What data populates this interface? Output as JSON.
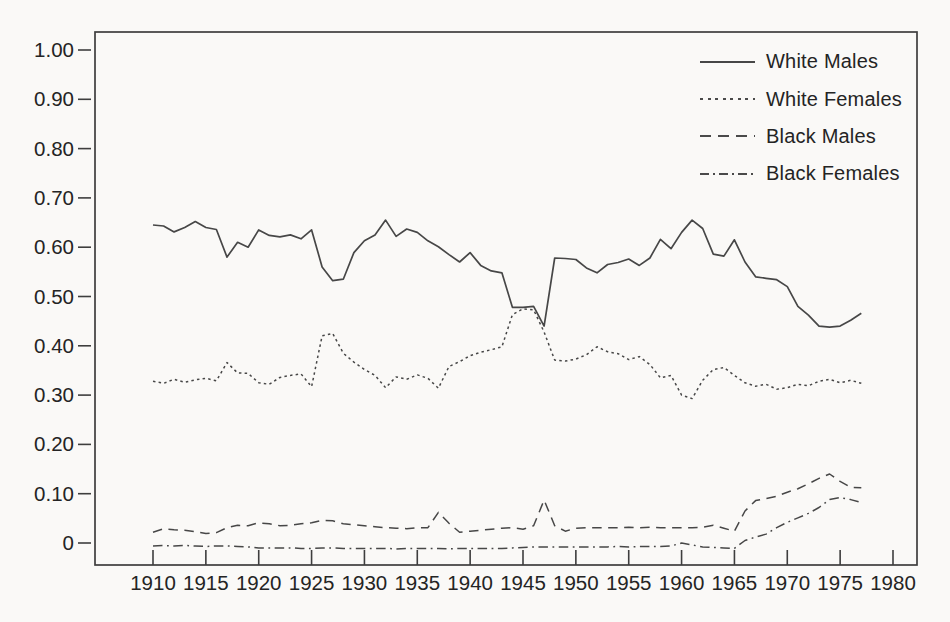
{
  "chart_data": {
    "type": "line",
    "title": "",
    "xlabel": "",
    "ylabel": "",
    "grid": false,
    "legend_position": "top-right",
    "xlim": [
      1904.5,
      1982
    ],
    "ylim": [
      -0.045,
      1.04
    ],
    "x_ticks": [
      1910,
      1915,
      1920,
      1925,
      1930,
      1935,
      1940,
      1945,
      1950,
      1955,
      1960,
      1965,
      1970,
      1975,
      1980
    ],
    "y_ticks": [
      0,
      0.1,
      0.2,
      0.3,
      0.4,
      0.5,
      0.6,
      0.7,
      0.8,
      0.9,
      1.0
    ],
    "y_tick_labels": [
      "0",
      "0.10",
      "0.20",
      "0.30",
      "0.40",
      "0.50",
      "0.60",
      "0.70",
      "0.80",
      "0.90",
      "1.00"
    ],
    "x": [
      1910,
      1911,
      1912,
      1913,
      1914,
      1915,
      1916,
      1917,
      1918,
      1919,
      1920,
      1921,
      1922,
      1923,
      1924,
      1925,
      1926,
      1927,
      1928,
      1929,
      1930,
      1931,
      1932,
      1933,
      1934,
      1935,
      1936,
      1937,
      1938,
      1939,
      1940,
      1941,
      1942,
      1943,
      1944,
      1945,
      1946,
      1947,
      1948,
      1949,
      1950,
      1951,
      1952,
      1953,
      1954,
      1955,
      1956,
      1957,
      1958,
      1959,
      1960,
      1961,
      1962,
      1963,
      1964,
      1965,
      1966,
      1967,
      1968,
      1969,
      1970,
      1971,
      1972,
      1973,
      1974,
      1975,
      1976,
      1977
    ],
    "series": [
      {
        "name": "White Males",
        "style": "solid",
        "values": [
          0.645,
          0.643,
          0.631,
          0.64,
          0.652,
          0.64,
          0.636,
          0.58,
          0.61,
          0.6,
          0.635,
          0.624,
          0.621,
          0.625,
          0.617,
          0.635,
          0.56,
          0.532,
          0.535,
          0.589,
          0.613,
          0.625,
          0.655,
          0.622,
          0.637,
          0.63,
          0.613,
          0.601,
          0.585,
          0.57,
          0.589,
          0.563,
          0.552,
          0.548,
          0.478,
          0.478,
          0.48,
          0.44,
          0.578,
          0.577,
          0.575,
          0.558,
          0.548,
          0.565,
          0.569,
          0.576,
          0.563,
          0.578,
          0.616,
          0.597,
          0.63,
          0.655,
          0.638,
          0.586,
          0.582,
          0.615,
          0.57,
          0.54,
          0.537,
          0.534,
          0.52,
          0.48,
          0.462,
          0.44,
          0.438,
          0.44,
          0.452,
          0.466
        ]
      },
      {
        "name": "White Females",
        "style": "dotted",
        "values": [
          0.328,
          0.324,
          0.332,
          0.326,
          0.331,
          0.334,
          0.329,
          0.366,
          0.345,
          0.344,
          0.325,
          0.322,
          0.336,
          0.34,
          0.343,
          0.317,
          0.42,
          0.425,
          0.385,
          0.367,
          0.352,
          0.34,
          0.315,
          0.337,
          0.332,
          0.341,
          0.334,
          0.314,
          0.358,
          0.368,
          0.38,
          0.387,
          0.392,
          0.398,
          0.463,
          0.475,
          0.473,
          0.428,
          0.371,
          0.369,
          0.373,
          0.382,
          0.398,
          0.388,
          0.384,
          0.372,
          0.378,
          0.362,
          0.335,
          0.34,
          0.3,
          0.293,
          0.33,
          0.352,
          0.356,
          0.34,
          0.325,
          0.318,
          0.322,
          0.312,
          0.315,
          0.322,
          0.319,
          0.328,
          0.332,
          0.325,
          0.33,
          0.324
        ]
      },
      {
        "name": "Black Males",
        "style": "dashed",
        "values": [
          0.022,
          0.029,
          0.027,
          0.026,
          0.023,
          0.019,
          0.021,
          0.031,
          0.036,
          0.035,
          0.041,
          0.039,
          0.035,
          0.036,
          0.039,
          0.041,
          0.046,
          0.045,
          0.039,
          0.037,
          0.035,
          0.033,
          0.031,
          0.03,
          0.029,
          0.031,
          0.031,
          0.062,
          0.04,
          0.022,
          0.024,
          0.026,
          0.028,
          0.03,
          0.031,
          0.028,
          0.035,
          0.087,
          0.035,
          0.024,
          0.03,
          0.031,
          0.031,
          0.031,
          0.031,
          0.032,
          0.031,
          0.032,
          0.031,
          0.031,
          0.031,
          0.031,
          0.032,
          0.036,
          0.03,
          0.024,
          0.065,
          0.086,
          0.09,
          0.095,
          0.103,
          0.11,
          0.12,
          0.131,
          0.14,
          0.125,
          0.113,
          0.112
        ]
      },
      {
        "name": "Black Females",
        "style": "dashdot",
        "values": [
          -0.006,
          -0.005,
          -0.006,
          -0.005,
          -0.006,
          -0.007,
          -0.006,
          -0.006,
          -0.007,
          -0.008,
          -0.01,
          -0.01,
          -0.01,
          -0.01,
          -0.011,
          -0.011,
          -0.01,
          -0.01,
          -0.011,
          -0.011,
          -0.011,
          -0.011,
          -0.011,
          -0.012,
          -0.011,
          -0.011,
          -0.011,
          -0.011,
          -0.012,
          -0.011,
          -0.011,
          -0.011,
          -0.011,
          -0.011,
          -0.01,
          -0.009,
          -0.008,
          -0.008,
          -0.008,
          -0.008,
          -0.008,
          -0.008,
          -0.008,
          -0.008,
          -0.007,
          -0.008,
          -0.007,
          -0.007,
          -0.007,
          -0.006,
          0.0,
          -0.004,
          -0.008,
          -0.009,
          -0.01,
          -0.011,
          0.005,
          0.012,
          0.018,
          0.031,
          0.042,
          0.051,
          0.06,
          0.072,
          0.088,
          0.092,
          0.088,
          0.082
        ]
      }
    ],
    "line_color": "#474747"
  },
  "legend": {
    "items": [
      {
        "label": "White Males"
      },
      {
        "label": "White Females"
      },
      {
        "label": "Black Males"
      },
      {
        "label": "Black Females"
      }
    ]
  }
}
